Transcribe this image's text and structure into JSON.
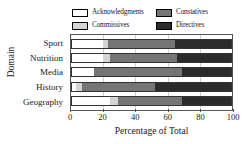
{
  "chart_data": {
    "type": "bar",
    "orientation": "horizontal",
    "stacked": true,
    "normalized": true,
    "title": "",
    "xlabel": "Percentage of Total",
    "ylabel": "Domain",
    "xlim": [
      0,
      100
    ],
    "xticks": [
      0,
      20,
      40,
      60,
      80,
      100
    ],
    "xticklabels": [
      "0",
      "20",
      "40",
      "60",
      "80",
      "100"
    ],
    "grid": true,
    "legend_position": "top",
    "categories": [
      "Sport",
      "Nutrition",
      "Media",
      "History",
      "Geography"
    ],
    "series": [
      {
        "name": "Acknowledgments",
        "color": "#ffffff",
        "values": [
          20,
          20,
          14,
          3,
          24.5
        ]
      },
      {
        "name": "Commissives",
        "color": "#d4d4d4",
        "values": [
          3,
          4,
          0,
          4,
          4.5
        ]
      },
      {
        "name": "Constatives",
        "color": "#757575",
        "values": [
          41.4,
          42,
          55,
          45,
          40
        ]
      },
      {
        "name": "Directives",
        "color": "#2b2b2b",
        "values": [
          35.6,
          34,
          31,
          48,
          31
        ]
      }
    ]
  },
  "legend": {
    "items": [
      {
        "label": "Acknowledgments",
        "color": "#ffffff"
      },
      {
        "label": "Constatives",
        "color": "#757575"
      },
      {
        "label": "Commissives",
        "color": "#d4d4d4"
      },
      {
        "label": "Directives",
        "color": "#2b2b2b"
      }
    ]
  },
  "axes": {
    "y_title": "Domain",
    "x_title": "Percentage of Total"
  }
}
